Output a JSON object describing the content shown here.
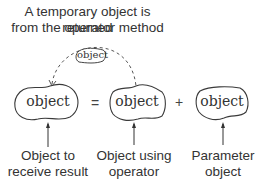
{
  "title": {
    "line1": "A temporary object is returned",
    "line2": "from the operator method"
  },
  "temporary_object": {
    "label": "object"
  },
  "expression": {
    "result_object": {
      "label": "object"
    },
    "equals_sign": "=",
    "operator_object": {
      "label": "object"
    },
    "plus_sign": "+",
    "parameter_object": {
      "label": "object"
    }
  },
  "captions": {
    "result": {
      "line1": "Object to",
      "line2": "receive result"
    },
    "operator": {
      "line1": "Object using",
      "line2": "operator"
    },
    "parameter": {
      "line1": "Parameter",
      "line2": "object"
    }
  },
  "colors": {
    "stroke": "#3a3a3a",
    "text": "#333333",
    "background": "#ffffff"
  }
}
